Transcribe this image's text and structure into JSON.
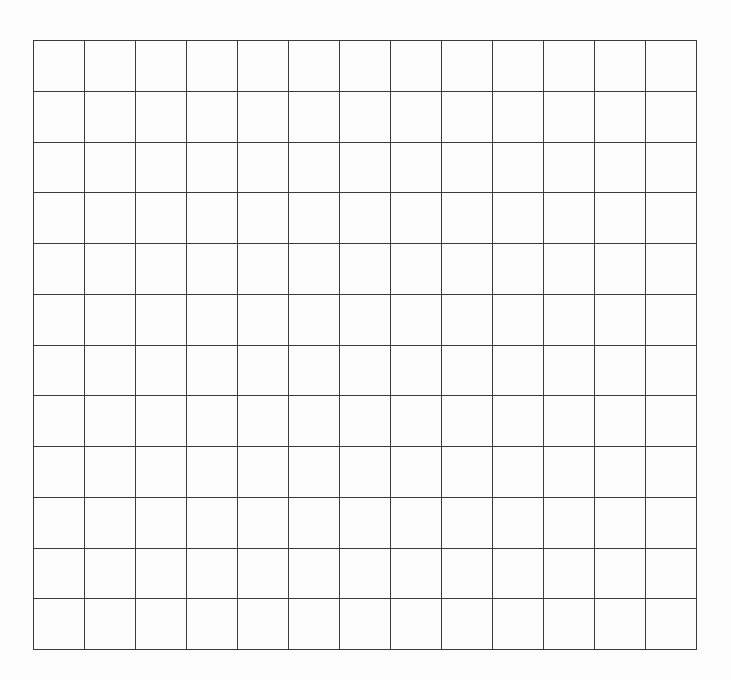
{
  "document": {
    "type": "blank-grid",
    "rows": 12,
    "columns": 13,
    "line_color": "#3a3a3a",
    "background_color": "#fdfdfd",
    "cells": []
  }
}
